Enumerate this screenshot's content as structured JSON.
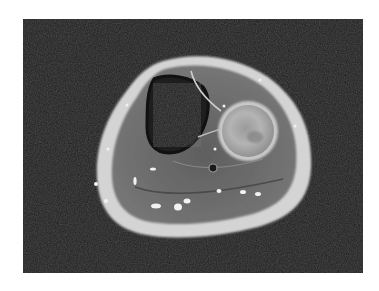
{
  "image": {
    "kind": "axial MRI cross-section of lower leg",
    "background_color": "#1c1c1c",
    "page_color": "#ffffff",
    "frame": {
      "x": 23,
      "y": 19,
      "width": 340,
      "height": 254
    },
    "colors": {
      "skin_fat_ring": "#d8d8d8",
      "muscle": "#6a6a6a",
      "dark_bone_region": "#2e2e2e",
      "bright_bone_region": "#a8a8a8",
      "vessel_dots": "#f0f0f0"
    }
  }
}
